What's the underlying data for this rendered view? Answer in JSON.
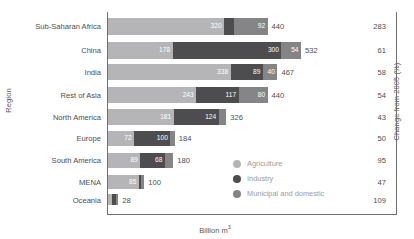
{
  "chart_data": {
    "type": "bar",
    "orientation": "horizontal",
    "stacked": true,
    "title": "",
    "xlabel": "Billion m³",
    "ylabel": "Region",
    "right_axis_label": "Change from 2005 (%)",
    "categories": [
      "Sub-Saharan Africa",
      "China",
      "India",
      "Rest of Asia",
      "North America",
      "Europe",
      "South America",
      "MENA",
      "Oceania"
    ],
    "series": [
      {
        "name": "Agriculture",
        "color": "#b5b5b7",
        "values": [
          320,
          178,
          338,
          243,
          181,
          72,
          89,
          85,
          12
        ]
      },
      {
        "name": "Industry",
        "color": "#4d4d4f",
        "values": [
          28,
          300,
          89,
          117,
          124,
          100,
          68,
          6,
          9
        ]
      },
      {
        "name": "Municipal and domestic",
        "color": "#858587",
        "values": [
          92,
          54,
          40,
          80,
          21,
          12,
          23,
          9,
          7
        ]
      }
    ],
    "totals": [
      440,
      532,
      467,
      440,
      326,
      184,
      180,
      100,
      28
    ],
    "change_from_2005": [
      283,
      61,
      58,
      54,
      43,
      50,
      95,
      47,
      109
    ],
    "segment_labels": [
      [
        "320",
        "28",
        "92"
      ],
      [
        "178",
        "300",
        "54"
      ],
      [
        "338",
        "89",
        "40"
      ],
      [
        "243",
        "117",
        "80"
      ],
      [
        "181",
        "124",
        "21"
      ],
      [
        "72",
        "100",
        "12"
      ],
      [
        "89",
        "68",
        "23"
      ],
      [
        "85",
        "6",
        "9"
      ],
      [
        "",
        "",
        ""
      ]
    ],
    "xlim": [
      0,
      532
    ],
    "grid": false,
    "legend_position": "inside-bottom-right"
  },
  "axes": {
    "y_title": "Region",
    "x_title_text": "Billion m",
    "x_title_sup": "3",
    "right_title": "Change from 2005 (%)"
  },
  "legend": {
    "items": [
      {
        "label": "Agriculture",
        "color": "#b5b5b7"
      },
      {
        "label": "Industry",
        "color": "#4d4d4f"
      },
      {
        "label": "Municipal and domestic",
        "color": "#858587"
      }
    ]
  }
}
